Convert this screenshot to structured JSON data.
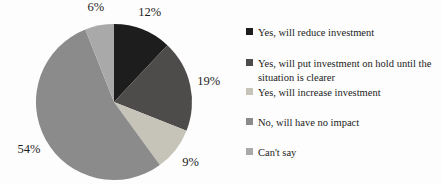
{
  "chart_data": {
    "type": "pie",
    "title": "",
    "legend_position": "right",
    "start_angle_deg": 0,
    "direction": "clockwise",
    "slices": [
      {
        "label": "Yes, will reduce investment",
        "value": 12,
        "pct_label": "12%",
        "color": "#1d1d1d"
      },
      {
        "label": "Yes, will put investment on hold until the\nsituation is clearer",
        "value": 19,
        "pct_label": "19%",
        "color": "#4e4b4b"
      },
      {
        "label": "Yes, will increase investment",
        "value": 9,
        "pct_label": "9%",
        "color": "#c6c4b8"
      },
      {
        "label": "No, will have no impact",
        "value": 54,
        "pct_label": "54%",
        "color": "#8b8b8b"
      },
      {
        "label": "Can't say",
        "value": 6,
        "pct_label": "6%",
        "color": "#a9a9a9"
      }
    ]
  }
}
